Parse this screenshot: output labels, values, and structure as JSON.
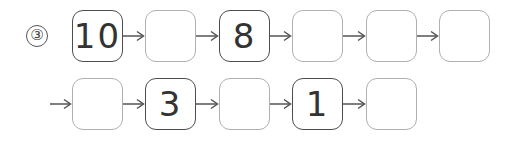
{
  "problem": {
    "label": "③",
    "rows": [
      {
        "leading_arrow": false,
        "boxes": [
          {
            "value": "10",
            "filled": true
          },
          {
            "value": "",
            "filled": false
          },
          {
            "value": "8",
            "filled": true
          },
          {
            "value": "",
            "filled": false
          },
          {
            "value": "",
            "filled": false
          },
          {
            "value": "",
            "filled": false
          }
        ]
      },
      {
        "leading_arrow": true,
        "boxes": [
          {
            "value": "",
            "filled": false
          },
          {
            "value": "3",
            "filled": true
          },
          {
            "value": "",
            "filled": false
          },
          {
            "value": "1",
            "filled": true
          },
          {
            "value": "",
            "filled": false
          }
        ]
      }
    ]
  },
  "colors": {
    "filled_border": "#4d4d4d",
    "empty_border": "#b0b0b0",
    "arrow": "#555555",
    "text": "#333333"
  }
}
